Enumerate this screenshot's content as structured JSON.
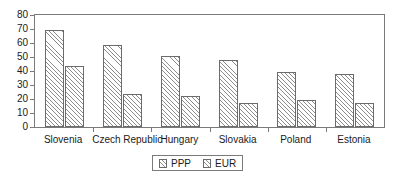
{
  "chart_data": {
    "type": "bar",
    "title": "",
    "subtitle": "",
    "xlabel": "",
    "ylabel": "",
    "ylim": [
      0,
      80
    ],
    "ytick_step": 10,
    "yticks": [
      "80",
      "70",
      "60",
      "50",
      "40",
      "30",
      "20",
      "10",
      "0"
    ],
    "grid": false,
    "legend_position": "bottom-center",
    "categories": [
      "Slovenia",
      "Czech Republic",
      "Hungary",
      "Slovakia",
      "Poland",
      "Estonia"
    ],
    "series": [
      {
        "name": "PPP",
        "values": [
          69,
          58.5,
          50.5,
          48,
          39,
          38
        ]
      },
      {
        "name": "EUR",
        "values": [
          43.5,
          23.5,
          22.5,
          17,
          19.5,
          17
        ]
      }
    ],
    "colors": {
      "axis": "#7a7a7a",
      "bar_outline": "#6b6b6b",
      "hatch": "#8c8c8c",
      "background": "#ffffff",
      "text": "#1a1a1a"
    }
  },
  "legend": {
    "items": [
      {
        "label": "PPP",
        "swatch_icon": "hatched-swatch-icon"
      },
      {
        "label": "EUR",
        "swatch_icon": "hatched-swatch-icon"
      }
    ]
  }
}
